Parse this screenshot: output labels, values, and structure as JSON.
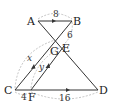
{
  "diagram": {
    "type": "geometry-figure",
    "points": {
      "A": {
        "label": "A",
        "x": 38,
        "y": 21
      },
      "B": {
        "label": "B",
        "x": 72,
        "y": 21
      },
      "C": {
        "label": "C",
        "x": 15,
        "y": 90
      },
      "D": {
        "label": "D",
        "x": 98,
        "y": 90
      },
      "G": {
        "label": "G",
        "x": 55,
        "y": 42
      },
      "E": {
        "label": "E",
        "x": 62,
        "y": 47
      },
      "F": {
        "label": "F",
        "x": 31,
        "y": 90
      }
    },
    "segments": [
      {
        "from": "A",
        "to": "B",
        "arrow": true
      },
      {
        "from": "C",
        "to": "D",
        "arrow": true
      },
      {
        "from": "A",
        "to": "D",
        "arrow": false
      },
      {
        "from": "B",
        "to": "C",
        "arrow": true
      },
      {
        "from": "E",
        "to": "F",
        "arrow": true
      }
    ],
    "measurements": {
      "AB": "8",
      "BE": "6",
      "CG": "x",
      "FE": "y",
      "CF": "4",
      "FD": "16"
    },
    "colors": {
      "line": "#333333",
      "dashed": "#aaaaaa",
      "text": "#222222"
    }
  }
}
